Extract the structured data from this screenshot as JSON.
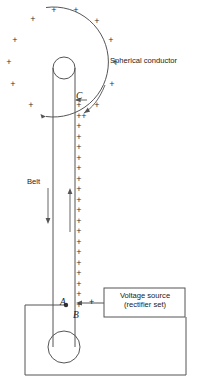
{
  "figure": {
    "stroke_color": "#555555",
    "text_color": "#222222",
    "charge_symbol": "+"
  },
  "labels": {
    "spherical_conductor": "Spherical conductor",
    "belt": "Belt",
    "comb_c": "C",
    "point_a": "A",
    "point_b": "B",
    "source_terminal_plus": "+",
    "voltage_source_line1": "Voltage source",
    "voltage_source_line2": "(rectifier set)"
  },
  "geometry": {
    "sphere": {
      "cx": 63,
      "cy": 62,
      "r": 55,
      "arc_start_deg": -108,
      "arc_end_deg": 108
    },
    "top_pulley": {
      "cx": 64,
      "cy": 68,
      "r": 11
    },
    "bottom_pulley": {
      "cx": 64,
      "cy": 347,
      "r": 16
    },
    "belt_left_x": 53,
    "belt_right_x": 75,
    "belt_top_y": 68,
    "belt_bottom_y": 347,
    "belt_down_arrow": {
      "x": 48,
      "y1": 188,
      "y2": 224
    },
    "belt_up_arrow": {
      "x": 70,
      "y1": 232,
      "y2": 188
    },
    "voltage_box": {
      "x": 104,
      "y": 288,
      "w": 81,
      "h": 29
    },
    "ground_loop": {
      "left": 25,
      "right": 186,
      "top": 305,
      "bottom": 375
    },
    "charge_column": {
      "x": 79,
      "y_start": 105,
      "y_end": 305,
      "count": 20
    },
    "sphere_charges": [
      {
        "x": 54,
        "y": 10
      },
      {
        "x": 76,
        "y": 10
      },
      {
        "x": 33,
        "y": 19
      },
      {
        "x": 97,
        "y": 21
      },
      {
        "x": 15,
        "y": 40
      },
      {
        "x": 111,
        "y": 40
      },
      {
        "x": 9,
        "y": 62
      },
      {
        "x": 115,
        "y": 62
      },
      {
        "x": 13,
        "y": 84
      },
      {
        "x": 112,
        "y": 84
      },
      {
        "x": 31,
        "y": 105
      },
      {
        "x": 97,
        "y": 105
      },
      {
        "x": 84,
        "y": 114
      }
    ]
  },
  "chart_data": {
    "type": "diagram",
    "components": [
      "Spherical conductor",
      "Belt",
      "Comb C",
      "Point A",
      "Point B",
      "Voltage source (rectifier set)",
      "Top pulley",
      "Bottom pulley",
      "Ground return wire"
    ]
  }
}
